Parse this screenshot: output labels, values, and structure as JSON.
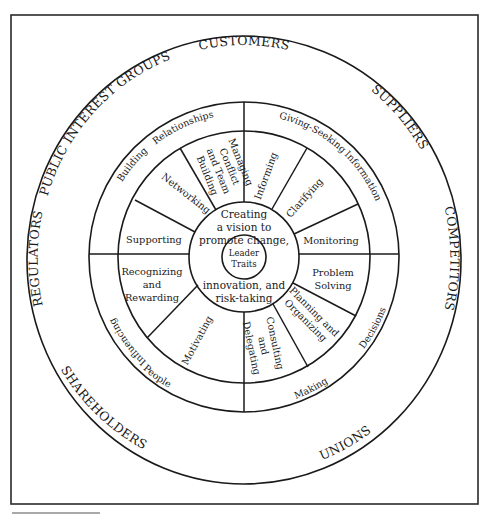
{
  "diagram": {
    "title": "",
    "outer_ring": {
      "labels": [
        "CUSTOMERS",
        "SUPPLIERS",
        "COMPETITORS",
        "UNIONS",
        "SHAREHOLDERS",
        "REGULATORS",
        "PUBLIC INTEREST GROUPS"
      ]
    },
    "middle_ring": {
      "labels": {
        "building": "Building",
        "relationships": "Relationships",
        "giving_seeking": "Giving-Seeking",
        "information": "Information",
        "decisions": "Decisions",
        "making": "Making",
        "people": "People",
        "influencing": "Influencing"
      }
    },
    "inner_ring": {
      "segments": {
        "managing": [
          "Managing",
          "Conflict",
          "and Team",
          "Building"
        ],
        "networking": "Networking",
        "supporting": "Supporting",
        "recognizing": [
          "Recognizing",
          "and",
          "Rewarding"
        ],
        "motivating": "Motivating",
        "consulting": [
          "Consulting",
          "and",
          "Delegating"
        ],
        "planning": [
          "Planning and",
          "Organizing"
        ],
        "problem": [
          "Problem",
          "Solving"
        ],
        "monitoring": "Monitoring",
        "clarifying": "Clarifying",
        "informing": "Informing"
      }
    },
    "core": {
      "top_lines": [
        "Creating",
        "a vision to",
        "promote change,"
      ],
      "bottom_lines": [
        "innovation, and",
        "risk-taking"
      ]
    },
    "center": {
      "lines": [
        "Leader",
        "Traits"
      ]
    }
  }
}
